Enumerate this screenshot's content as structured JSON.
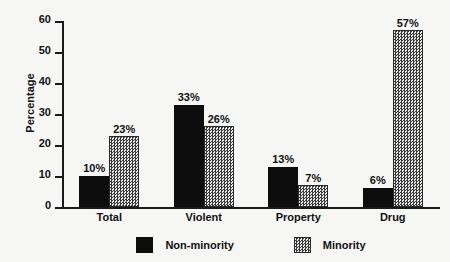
{
  "chart_data": {
    "type": "bar",
    "title": "",
    "subtitle": "",
    "xlabel": "",
    "ylabel": "Percentage",
    "ylim": [
      0,
      60
    ],
    "yticks": [
      0,
      10,
      20,
      30,
      40,
      50,
      60
    ],
    "ytick_labels": [
      "0",
      "10",
      "20",
      "30",
      "40",
      "50",
      "60"
    ],
    "grid": false,
    "legend_position": "bottom",
    "categories": [
      "Total",
      "Violent",
      "Property",
      "Drug"
    ],
    "series": [
      {
        "name": "Non-minority",
        "pattern": "solid-black",
        "color": "#0d0d0d",
        "values": [
          10,
          33,
          13,
          6
        ],
        "labels": [
          "10%",
          "33%",
          "13%",
          "6%"
        ]
      },
      {
        "name": "Minority",
        "pattern": "checkered-gray",
        "color": "#3a3a3a",
        "values": [
          23,
          26,
          7,
          57
        ],
        "labels": [
          "23%",
          "26%",
          "7%",
          "57%"
        ]
      }
    ]
  },
  "axis": {
    "y_label": "Percentage"
  },
  "legend": {
    "items": [
      {
        "label": "Non-minority"
      },
      {
        "label": "Minority"
      }
    ]
  }
}
